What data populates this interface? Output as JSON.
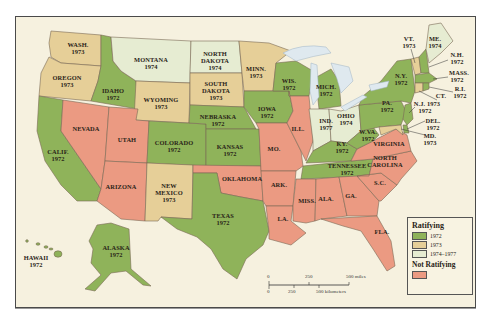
{
  "map": {
    "title": "Ratification of the Equal Rights Amendment",
    "colors": {
      "ratified_1972": "#8fb35a",
      "ratified_1973": "#e6cf98",
      "ratified_1974_1977": "#e6ecd2",
      "not_ratifying": "#eb9a82",
      "water": "#dfe9ef",
      "background": "#f6f1df"
    },
    "states": {
      "wa": {
        "name": "WASH.",
        "year": "1973"
      },
      "or": {
        "name": "OREGON",
        "year": "1973"
      },
      "ca": {
        "name": "CALIF.",
        "year": "1972"
      },
      "id": {
        "name": "IDAHO",
        "year": "1972"
      },
      "nv": {
        "name": "NEVADA",
        "year": ""
      },
      "mt": {
        "name": "MONTANA",
        "year": "1974"
      },
      "wy": {
        "name": "WYOMING",
        "year": "1973"
      },
      "ut": {
        "name": "UTAH",
        "year": ""
      },
      "az": {
        "name": "ARIZONA",
        "year": ""
      },
      "co": {
        "name": "COLORADO",
        "year": "1972"
      },
      "nm": {
        "name": "NEW MEXICO",
        "year": "1973"
      },
      "nd": {
        "name": "NORTH DAKOTA",
        "year": "1974"
      },
      "sd": {
        "name": "SOUTH DAKOTA",
        "year": "1973"
      },
      "ne": {
        "name": "NEBRASKA",
        "year": "1972"
      },
      "ks": {
        "name": "KANSAS",
        "year": "1972"
      },
      "ok": {
        "name": "OKLAHOMA",
        "year": ""
      },
      "tx": {
        "name": "TEXAS",
        "year": "1972"
      },
      "mn": {
        "name": "MINN.",
        "year": "1973"
      },
      "ia": {
        "name": "IOWA",
        "year": "1972"
      },
      "mo": {
        "name": "MO.",
        "year": ""
      },
      "ar": {
        "name": "ARK.",
        "year": ""
      },
      "la": {
        "name": "LA.",
        "year": ""
      },
      "wi": {
        "name": "WIS.",
        "year": "1972"
      },
      "il": {
        "name": "ILL.",
        "year": ""
      },
      "mi": {
        "name": "MICH.",
        "year": "1972"
      },
      "in": {
        "name": "IND.",
        "year": "1977"
      },
      "oh": {
        "name": "OHIO",
        "year": "1974"
      },
      "ky": {
        "name": "KY.",
        "year": "1972"
      },
      "tn": {
        "name": "TENNESSEE",
        "year": "1972"
      },
      "ms": {
        "name": "MISS.",
        "year": ""
      },
      "al": {
        "name": "ALA.",
        "year": ""
      },
      "ga": {
        "name": "GA.",
        "year": ""
      },
      "fl": {
        "name": "FLA.",
        "year": ""
      },
      "sc": {
        "name": "S.C.",
        "year": ""
      },
      "nc": {
        "name": "NORTH CAROLINA",
        "year": ""
      },
      "va": {
        "name": "VIRGINIA",
        "year": ""
      },
      "wv": {
        "name": "W.VA.",
        "year": "1972"
      },
      "pa": {
        "name": "PA.",
        "year": "1972"
      },
      "ny": {
        "name": "N.Y.",
        "year": "1972"
      },
      "vt": {
        "name": "VT.",
        "year": "1973"
      },
      "me": {
        "name": "ME.",
        "year": "1974"
      },
      "nh": {
        "name": "N.H.",
        "year": "1972"
      },
      "ma": {
        "name": "MASS.",
        "year": "1972"
      },
      "ri": {
        "name": "R.I.",
        "year": "1972"
      },
      "ct": {
        "name": "CT.",
        "year": "1973"
      },
      "nj": {
        "name": "N.J.",
        "year": "1973"
      },
      "nj_ct_line": "N.J. 1973",
      "ct_line": "CT.",
      "de": {
        "name": "DEL.",
        "year": "1972"
      },
      "md": {
        "name": "MD.",
        "year": "1973"
      },
      "ak": {
        "name": "ALASKA",
        "year": "1972"
      },
      "hi": {
        "name": "HAWAII",
        "year": "1972"
      }
    },
    "extra_labels": {
      "nd_line1": "NORTH",
      "nd_line2": "DAKOTA",
      "sd_line1": "SOUTH",
      "sd_line2": "DAKOTA",
      "nm_line1": "NEW",
      "nm_line2": "MEXICO",
      "nc_line1": "NORTH",
      "nc_line2": "CAROLINA",
      "ct_nj_year": "1972"
    }
  },
  "legend": {
    "title_ratifying": "Ratifying",
    "items": [
      {
        "label": "1972",
        "color": "#8fb35a"
      },
      {
        "label": "1973",
        "color": "#e6cf98"
      },
      {
        "label": "1974–1977",
        "color": "#e6ecd2"
      }
    ],
    "title_not_ratifying": "Not Ratifying",
    "not_ratifying_color": "#eb9a82"
  },
  "scale_bar": {
    "miles_ticks": [
      "0",
      "250",
      "500 miles"
    ],
    "km_ticks": [
      "0",
      "250",
      "500 kilometers"
    ]
  }
}
